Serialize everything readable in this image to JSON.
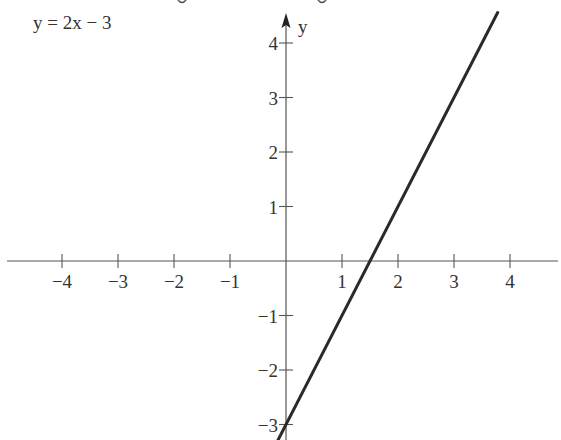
{
  "chart_data": {
    "type": "line",
    "title": "",
    "equation_label": "y = 2x − 3",
    "xlabel": "",
    "ylabel": "y",
    "series": [
      {
        "name": "y = 2x − 3",
        "x": [
          -0.15,
          3.78
        ],
        "y": [
          -3.3,
          4.56
        ],
        "slope": 2,
        "intercept": -3
      }
    ],
    "x_ticks": [
      -4,
      -3,
      -2,
      -1,
      1,
      2,
      3,
      4
    ],
    "x_tick_labels": [
      "−4",
      "−3",
      "−2",
      "−1",
      "1",
      "2",
      "3",
      "4"
    ],
    "y_ticks": [
      -3,
      -2,
      -1,
      1,
      2,
      3,
      4
    ],
    "y_tick_labels": [
      "−3",
      "−2",
      "−1",
      "1",
      "2",
      "3",
      "4"
    ],
    "xlim": [
      -5,
      4.9
    ],
    "ylim": [
      -3.3,
      4.5
    ],
    "grid": false,
    "legend": "none",
    "x_intercept": 1.5,
    "y_intercept": -3
  },
  "colors": {
    "axis": "#555555",
    "line": "#2a2a2a",
    "text": "#333333"
  }
}
